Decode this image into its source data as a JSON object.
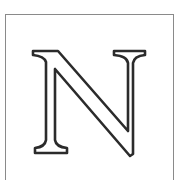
{
  "illustration": {
    "letter": "N",
    "style": "outlined serif capital",
    "stroke_color": "#2b2b2b",
    "frame_color": "#8a8a8a",
    "background_color": "#ffffff"
  }
}
